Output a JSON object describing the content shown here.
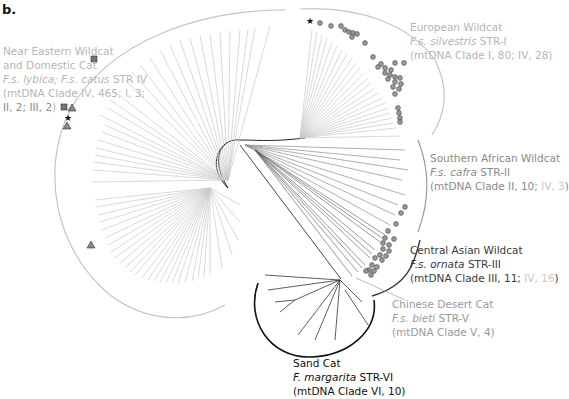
{
  "panel_label": "b.",
  "clades": [
    {
      "id": "near-eastern",
      "name": "Near Eastern Wildcat",
      "name2": "and Domestic Cat",
      "taxon_italic": "F.s. lybica; F.s. catus",
      "str": "STR IV",
      "mtdna_prefix": "(mtDNA Clade IV, 465; I, 3;",
      "mtdna_tail": "II, 2; III, 2",
      "mtdna_close": ")",
      "color": "#b5b5b5"
    },
    {
      "id": "european",
      "name": "European Wildcat",
      "taxon_italic": "F.s. silvestris",
      "str": "STR-I",
      "mtdna": "(mtDNA Clade I, 80; IV, 28)",
      "color": "#c0c0c0"
    },
    {
      "id": "southern-african",
      "name": "Southern African Wildcat",
      "taxon_italic": "F.s. cafra",
      "str": "STR-II",
      "mtdna_prefix": "(mtDNA Clade II, 10; ",
      "mtdna_faint": "IV, 3",
      "mtdna_close": ")",
      "color": "#8a8a8a"
    },
    {
      "id": "central-asian",
      "name": "Central Asian Wildcat",
      "taxon_italic": "F.s. ornata",
      "str": "STR-III",
      "mtdna_prefix": "(mtDNA Clade III, 11; ",
      "mtdna_faint": "IV, 16",
      "mtdna_close": ")",
      "color": "#3a3a3a"
    },
    {
      "id": "chinese-desert",
      "name": "Chinese Desert Cat",
      "taxon_italic": "F.s. bieti",
      "str": "STR-V",
      "mtdna": "(mtDNA Clade V, 4)",
      "color": "#9a9a9a"
    },
    {
      "id": "sand-cat",
      "name": "Sand Cat",
      "taxon_italic": "F. margarita",
      "str": "STR-VI",
      "mtdna": "(mtDNA Clade VI, 10)",
      "color": "#111111"
    }
  ],
  "markers": {
    "legend_symbols": [
      "grey-square",
      "grey-triangle",
      "black-star",
      "grey-circle"
    ]
  }
}
